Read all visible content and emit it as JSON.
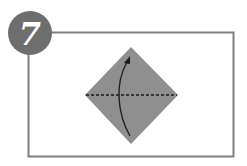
{
  "step": {
    "number": "7",
    "badge_color": "#6e6e6e",
    "number_color": "#ffffff"
  },
  "frame": {
    "stroke": "#7f7f7f"
  },
  "paper": {
    "fill": "#8f8f8f",
    "shape": "diamond"
  },
  "fold_line": {
    "style": "dashed",
    "color": "#1a1a1a",
    "meaning": "valley fold along horizontal diagonal"
  },
  "arrow": {
    "direction": "fold bottom corner up to top corner",
    "color": "#1a1a1a"
  }
}
